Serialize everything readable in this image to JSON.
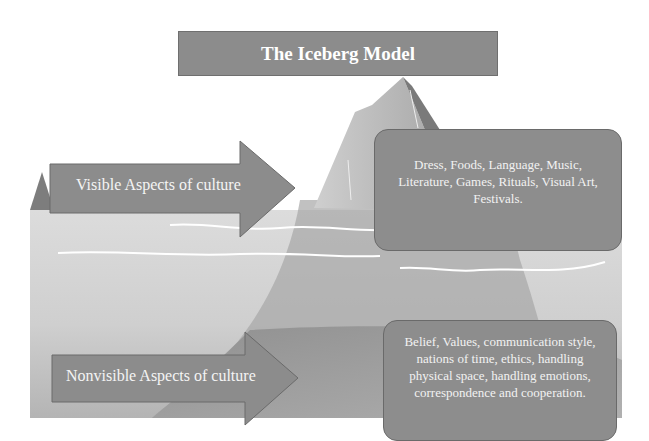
{
  "title": "The Iceberg Model",
  "arrows": [
    {
      "label": "Visible Aspects of culture"
    },
    {
      "label": "Nonvisible Aspects of culture"
    }
  ],
  "boxes": [
    {
      "lines": [
        "Dress, Foods, Language, Music,",
        "Literature, Games, Rituals, Visual Art,",
        "Festivals."
      ]
    },
    {
      "lines": [
        "Belief, Values, communication style,",
        "nations of time, ethics, handling",
        "physical space, handling emotions,",
        "correspondence and cooperation."
      ]
    }
  ],
  "colors": {
    "shape_fill": "#8c8c8c",
    "shape_border": "#6a6a6a",
    "water_light": "#d6d6d6",
    "water_dark": "#9a9a9a",
    "iceberg_light": "#b9b9b9",
    "iceberg_dark": "#7a7a7a",
    "text": "#ffffff"
  }
}
